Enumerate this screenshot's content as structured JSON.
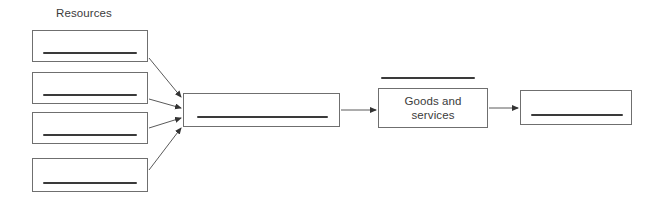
{
  "diagram": {
    "type": "flow-diagram",
    "title_label": "Resources",
    "background_color": "#ffffff",
    "box_border_color": "#6f6f6f",
    "answer_line_color": "#3a3a3a",
    "text_color": "#3b3b3b",
    "arrow_color": "#5a5a5a",
    "input_boxes": [
      {
        "id": "resource-1",
        "label": "",
        "has_answer_line": true,
        "x": 32,
        "y": 30,
        "width": 116,
        "height": 32
      },
      {
        "id": "resource-2",
        "label": "",
        "has_answer_line": true,
        "x": 32,
        "y": 72,
        "width": 116,
        "height": 32
      },
      {
        "id": "resource-3",
        "label": "",
        "has_answer_line": true,
        "x": 32,
        "y": 112,
        "width": 116,
        "height": 32
      },
      {
        "id": "resource-4",
        "label": "",
        "has_answer_line": true,
        "x": 32,
        "y": 158,
        "width": 116,
        "height": 34
      }
    ],
    "center_box": {
      "id": "center-process",
      "label": "",
      "has_answer_line": true,
      "x": 183,
      "y": 93,
      "width": 157,
      "height": 34
    },
    "goods_box": {
      "id": "goods-and-services",
      "label": "Goods and\nservices",
      "has_answer_line": false,
      "x": 378,
      "y": 88,
      "width": 110,
      "height": 40
    },
    "goods_top_answer_line": {
      "id": "goods-top-line",
      "x": 381,
      "y": 77,
      "width": 94
    },
    "output_box": {
      "id": "output-box",
      "label": "",
      "has_answer_line": true,
      "x": 520,
      "y": 90,
      "width": 112,
      "height": 35
    },
    "arrows": [
      {
        "id": "arrow-resource-1-to-center",
        "x1": 149,
        "y1": 58,
        "x2": 181,
        "y2": 97
      },
      {
        "id": "arrow-resource-2-to-center",
        "x1": 149,
        "y1": 99,
        "x2": 181,
        "y2": 108
      },
      {
        "id": "arrow-resource-3-to-center",
        "x1": 149,
        "y1": 128,
        "x2": 181,
        "y2": 118
      },
      {
        "id": "arrow-resource-4-to-center",
        "x1": 149,
        "y1": 170,
        "x2": 181,
        "y2": 128
      },
      {
        "id": "arrow-center-to-goods",
        "x1": 341,
        "y1": 110,
        "x2": 376,
        "y2": 110
      },
      {
        "id": "arrow-goods-to-output",
        "x1": 489,
        "y1": 108,
        "x2": 518,
        "y2": 108
      }
    ]
  }
}
